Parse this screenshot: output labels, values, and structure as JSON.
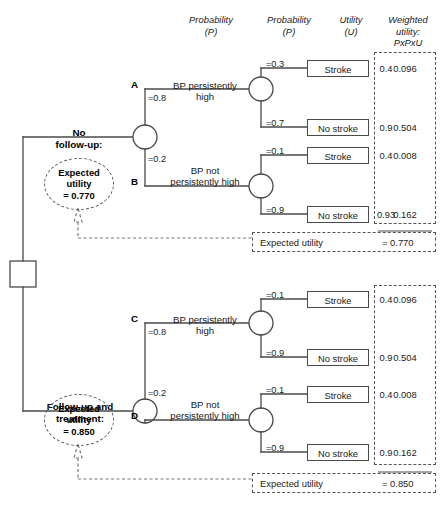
{
  "diagram": {
    "headers": {
      "probability1": "Probability\n(P)",
      "probability2": "Probability\n(P)",
      "utility": "Utility\n(U)",
      "weighted": "Weighted\nutility:\nPxPxU"
    },
    "branch_labels": {
      "bp_high": "BP persistently\nhigh",
      "bp_not_high": "BP not\npersistently high"
    },
    "outcomes": {
      "stroke": "Stroke",
      "no_stroke": "No stroke"
    },
    "expected_utility_label": "Expected utility",
    "oval_label": "Expected\nutility"
  },
  "arms": [
    {
      "name": "no-follow-up",
      "title": "No\nfollow-up:",
      "oval_line1": "Expected",
      "oval_line2": "utility",
      "oval_line3": "= 0.770",
      "expected_utility": "= 0.770",
      "nodes": [
        {
          "letter": "A",
          "prob": "=0.8",
          "label": "BP persistently\nhigh",
          "leaves": [
            {
              "prob": "=0.3",
              "outcome": "Stroke",
              "utility": "0.4",
              "weighted": "0.096"
            },
            {
              "prob": "=0.7",
              "outcome": "No stroke",
              "utility": "0.9",
              "weighted": "0.504"
            }
          ]
        },
        {
          "letter": "B",
          "prob": "=0.2",
          "label": "BP not\npersistently high",
          "leaves": [
            {
              "prob": "=0.1",
              "outcome": "Stroke",
              "utility": "0.4",
              "weighted": "0.008"
            },
            {
              "prob": "=0.9",
              "outcome": "No stroke",
              "utility": "0.93",
              "weighted": "0.162"
            }
          ]
        }
      ]
    },
    {
      "name": "follow-up-and-treatment",
      "title": "Follow-up and\ntreatment:",
      "oval_line1": "Expected",
      "oval_line2": "utility",
      "oval_line3": "= 0.850",
      "expected_utility": "= 0.850",
      "nodes": [
        {
          "letter": "C",
          "prob": "=0.8",
          "label": "BP persistently\nhigh",
          "leaves": [
            {
              "prob": "=0.1",
              "outcome": "Stroke",
              "utility": "0.4",
              "weighted": "0.096"
            },
            {
              "prob": "=0.9",
              "outcome": "No stroke",
              "utility": "0.9",
              "weighted": "0.504"
            }
          ]
        },
        {
          "letter": "D",
          "prob": "=0.2",
          "label": "BP not\npersistently high",
          "leaves": [
            {
              "prob": "=0.1",
              "outcome": "Stroke",
              "utility": "0.4",
              "weighted": "0.008"
            },
            {
              "prob": "=0.9",
              "outcome": "No stroke",
              "utility": "0.9",
              "weighted": "0.162"
            }
          ]
        }
      ]
    }
  ],
  "colors": {
    "line": "#4a4a4a",
    "dashed": "#555555",
    "text": "#1a1a1a"
  }
}
